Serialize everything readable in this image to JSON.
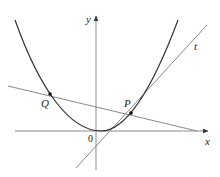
{
  "figure": {
    "type": "diagram",
    "labels": {
      "y_axis": "y",
      "x_axis": "x",
      "origin": "0",
      "point_p": "P",
      "point_q": "Q",
      "tangent": "t"
    },
    "colors": {
      "curve": "#333333",
      "lines": "#8a8a8a",
      "axes": "#8a8a8a",
      "text": "#222222"
    }
  }
}
